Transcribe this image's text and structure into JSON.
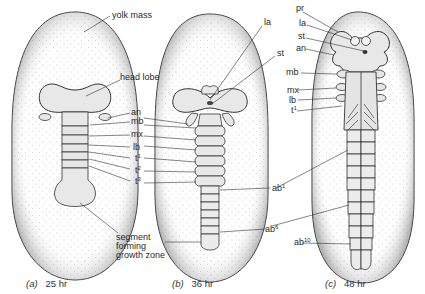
{
  "figure": {
    "panels": [
      {
        "id": "a",
        "caption_letter": "(a)",
        "caption_time": "25 hr",
        "labels": {
          "yolk_mass": "yolk mass",
          "head_lobe": "head lobe",
          "an": "an",
          "mb": "mb",
          "mx": "mx",
          "lb": "lb",
          "t1": "t",
          "t1_sup": "1",
          "t2": "t",
          "t2_sup": "2",
          "t3": "t",
          "t3_sup": "3",
          "growth_zone_1": "segment",
          "growth_zone_2": "forming",
          "growth_zone_3": "growth zone"
        }
      },
      {
        "id": "b",
        "caption_letter": "(b)",
        "caption_time": "36 hr",
        "labels": {
          "la": "la",
          "st": "st",
          "ab1": "ab",
          "ab1_sup": "1",
          "ab6": "ab",
          "ab6_sup": "6"
        }
      },
      {
        "id": "c",
        "caption_letter": "(c)",
        "caption_time": "48 hr",
        "labels": {
          "pr": "pr",
          "la": "la",
          "st": "st",
          "an": "an",
          "mb": "mb",
          "mx": "mx",
          "lb": "lb",
          "t1": "t",
          "t1_sup": "1",
          "ab10": "ab",
          "ab10_sup": "10"
        }
      }
    ],
    "colors": {
      "ink": "#2a2a2a",
      "stipple": "#9a9a9a",
      "background": "#ffffff"
    }
  }
}
